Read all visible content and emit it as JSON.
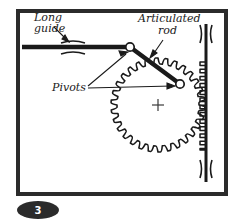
{
  "figure": {
    "badge_number": "3",
    "background_color": "#ffffff",
    "ink_color": "#1a1a1a",
    "frame": {
      "x": 16,
      "y": 9,
      "width": 212,
      "height": 187,
      "stroke_width": 4
    },
    "labels": {
      "long_guide": "Long\nguide",
      "long_guide_line1": "Long",
      "long_guide_line2": "guide",
      "articulated_rod": "Articulated\nrod",
      "articulated_rod_line1": "Articulated",
      "articulated_rod_line2": "rod",
      "pivots": "Pivots"
    },
    "parts": {
      "horizontal_guide_label": "Long guide",
      "vertical_rack_label": "Vertical rack",
      "gear_label": "Toothed gear wheel",
      "rod_label": "Articulated rod",
      "pivot_left_label": "Pivot (guide end)",
      "pivot_right_label": "Pivot (gear end)",
      "center_mark_label": "Gear centre cross"
    },
    "geometry": {
      "gear": {
        "cx": 158,
        "cy": 105,
        "outer_radius": 47,
        "root_radius": 41,
        "tooth_count": 30
      },
      "horizontal_guide": {
        "x1": 22,
        "x2": 130,
        "y": 47,
        "thickness": 4
      },
      "vertical_rack": {
        "x": 206,
        "y1": 24,
        "y2": 182,
        "thickness": 3
      },
      "articulated_rod": {
        "x1": 130,
        "y1": 47,
        "x2": 179,
        "y2": 84,
        "thickness": 4
      },
      "pivot_left": {
        "cx": 130,
        "cy": 47,
        "r": 4
      },
      "pivot_right": {
        "cx": 179,
        "cy": 84,
        "r": 4
      },
      "center_cross": {
        "cx": 158,
        "cy": 105,
        "arm": 6
      }
    },
    "badge": {
      "cx": 38,
      "cy": 210,
      "rx": 21,
      "ry": 9,
      "fill": "#2b2b2b"
    }
  }
}
